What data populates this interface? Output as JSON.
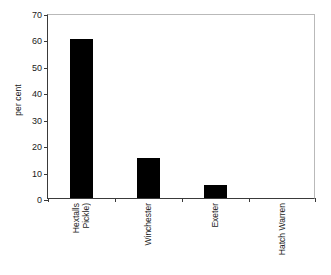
{
  "chart_data": {
    "type": "bar",
    "title": "",
    "subtitle": "",
    "xlabel": "",
    "ylabel": "per cent",
    "categories": [
      "Hextalls (Pickle)",
      "Winchester",
      "Exeter",
      "Hatch Warren"
    ],
    "category_lines": [
      [
        "Hextalls",
        "Pickle)"
      ],
      [
        "Winchester"
      ],
      [
        "Exeter"
      ],
      [
        "Hatch Warren"
      ]
    ],
    "values": [
      60,
      15,
      5,
      0
    ],
    "ylim": [
      0,
      70
    ],
    "ytick_step": 10,
    "yticks": [
      0,
      10,
      20,
      30,
      40,
      50,
      60,
      70
    ],
    "ytick_labels": [
      "0",
      "10",
      "20",
      "30",
      "40",
      "50",
      "60",
      "70"
    ],
    "grid": false,
    "legend": false,
    "legend_position": "none",
    "bar_color": "#000000",
    "axis_color": "#3a3a3a",
    "frame_color": "#b9b9b9"
  }
}
